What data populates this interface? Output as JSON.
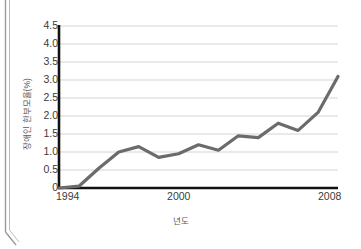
{
  "chart_data": {
    "type": "line",
    "title": "",
    "xlabel": "년도",
    "ylabel": "장애인 한부모율(%)",
    "xlim": [
      1994,
      2008
    ],
    "ylim": [
      0,
      4.5
    ],
    "grid": true,
    "legend": null,
    "line_color": "#6b6b6b",
    "x": [
      1994,
      1995,
      1996,
      1997,
      1998,
      1999,
      2000,
      2001,
      2002,
      2003,
      2004,
      2005,
      2006,
      2007,
      2008
    ],
    "values": [
      0.0,
      0.05,
      0.55,
      1.0,
      1.15,
      0.85,
      0.95,
      1.2,
      1.05,
      1.45,
      1.4,
      1.8,
      1.6,
      2.1,
      3.1
    ],
    "ytick_labels": [
      "4.5",
      "4.0",
      "3.5",
      "3.0",
      "2.5",
      "2.0",
      "1.5",
      "1.0",
      "0.5",
      "0"
    ],
    "ytick_values": [
      4.5,
      4.0,
      3.5,
      3.0,
      2.5,
      2.0,
      1.5,
      1.0,
      0.5,
      0
    ],
    "xtick_labels": [
      "1994",
      "2000",
      "2008"
    ],
    "xtick_values": [
      1994,
      2000,
      2008
    ]
  },
  "axes": {
    "y_title": "장애인 한부모율(%)",
    "x_title": "년도"
  },
  "ticks": {
    "y": [
      "4.5",
      "4.0",
      "3.5",
      "3.0",
      "2.5",
      "2.0",
      "1.5",
      "1.0",
      "0.5",
      "0"
    ],
    "x": [
      "1994",
      "2000",
      "2008"
    ]
  }
}
